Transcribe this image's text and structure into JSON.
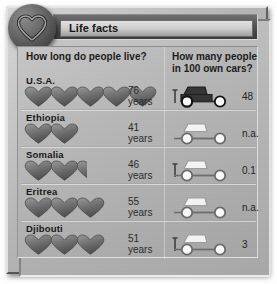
{
  "window": {
    "title": "Life facts",
    "logo_icon": "heart-icon"
  },
  "columns": {
    "left_heading": "How long do people live?",
    "right_heading": "How many people in 100 own cars?"
  },
  "colors": {
    "frame": "#b5b5b5",
    "board": "#b6b6b6",
    "title_bar": "#4c4c4c",
    "ink": "#1b1b1b",
    "heart_fill": "#6f6f6f",
    "car_dark": "#3a3a3a",
    "car_light": "#f2f2f2"
  },
  "units": {
    "years": "years"
  },
  "rows": [
    {
      "country": "U.S.A.",
      "life_expectancy": "76",
      "life_unit": "years",
      "hearts_full": 5,
      "hearts_half": 0,
      "cars_per_100": "48",
      "car_style": "filled"
    },
    {
      "country": "Ethiopia",
      "life_expectancy": "41",
      "life_unit": "years",
      "hearts_full": 2,
      "hearts_half": 0,
      "cars_per_100": "n.a.",
      "car_style": "outline"
    },
    {
      "country": "Somalia",
      "life_expectancy": "46",
      "life_unit": "years",
      "hearts_full": 2,
      "hearts_half": 1,
      "cars_per_100": "0.1",
      "car_style": "outline-tick"
    },
    {
      "country": "Eritrea",
      "life_expectancy": "55",
      "life_unit": "years",
      "hearts_full": 3,
      "hearts_half": 0,
      "cars_per_100": "n.a.",
      "car_style": "outline"
    },
    {
      "country": "Djibouti",
      "life_expectancy": "51",
      "life_unit": "years",
      "hearts_full": 3,
      "hearts_half": 0,
      "cars_per_100": "3",
      "car_style": "outline-tick"
    }
  ],
  "chart_data": {
    "type": "bar",
    "title": "Life facts",
    "categories": [
      "U.S.A.",
      "Ethiopia",
      "Somalia",
      "Eritrea",
      "Djibouti"
    ],
    "series": [
      {
        "name": "How long do people live? (years)",
        "units": "years",
        "glyph": "heart",
        "glyph_value": 15,
        "values": [
          76,
          41,
          46,
          55,
          51
        ],
        "glyph_counts": [
          5,
          2,
          2.5,
          3,
          3
        ],
        "labels": [
          "76 years",
          "41 years",
          "46 years",
          "55 years",
          "51 years"
        ]
      },
      {
        "name": "How many people in 100 own cars?",
        "units": "people per 100",
        "glyph": "car",
        "values": [
          48,
          null,
          0.1,
          null,
          3
        ],
        "labels": [
          "48",
          "n.a.",
          "0.1",
          "n.a.",
          "3"
        ]
      }
    ],
    "xlabel": "",
    "ylabel": "",
    "grid": false,
    "legend": "none"
  }
}
